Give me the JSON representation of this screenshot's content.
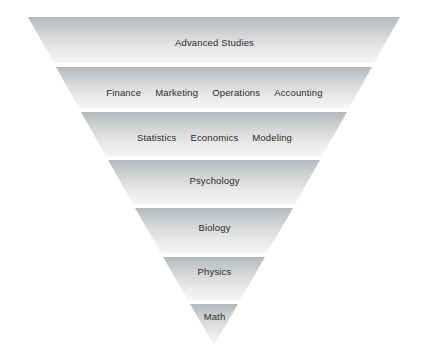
{
  "diagram": {
    "type": "inverted-pyramid-funnel",
    "title": "",
    "background_color": "#ffffff",
    "text_color": "#2b2b2b",
    "band_gradient": {
      "top_color": "#b6b9bb",
      "bottom_color": "#f2f3f3"
    },
    "apex": {
      "x": 214,
      "y": 345
    },
    "top_left": {
      "x": 28,
      "y": 17
    },
    "top_right": {
      "x": 400,
      "y": 17
    },
    "bands": [
      {
        "index": 1,
        "name": "advanced-studies",
        "labels": [
          "Advanced Studies"
        ],
        "label_y": 43,
        "top_y": 17,
        "bottom_y": 63,
        "top_left_x": 28,
        "top_right_x": 400,
        "bottom_left_x": 54,
        "bottom_right_x": 374
      },
      {
        "index": 2,
        "name": "business-disciplines",
        "labels": [
          "Finance",
          "Marketing",
          "Operations",
          "Accounting"
        ],
        "label_y": 93,
        "top_y": 67,
        "bottom_y": 108,
        "top_left_x": 56,
        "top_right_x": 372,
        "bottom_left_x": 79,
        "bottom_right_x": 349
      },
      {
        "index": 3,
        "name": "quantitative-disciplines",
        "labels": [
          "Statistics",
          "Economics",
          "Modeling"
        ],
        "label_y": 138,
        "top_y": 112,
        "bottom_y": 156,
        "top_left_x": 81,
        "top_right_x": 347,
        "bottom_left_x": 106,
        "bottom_right_x": 322
      },
      {
        "index": 4,
        "name": "psychology",
        "labels": [
          "Psychology"
        ],
        "label_y": 181,
        "top_y": 160,
        "bottom_y": 204,
        "top_left_x": 108,
        "top_right_x": 320,
        "bottom_left_x": 133,
        "bottom_right_x": 295
      },
      {
        "index": 5,
        "name": "biology",
        "labels": [
          "Biology"
        ],
        "label_y": 228,
        "top_y": 208,
        "bottom_y": 253,
        "top_left_x": 135,
        "top_right_x": 293,
        "bottom_left_x": 161,
        "bottom_right_x": 267
      },
      {
        "index": 6,
        "name": "physics",
        "labels": [
          "Physics"
        ],
        "label_y": 272,
        "top_y": 257,
        "bottom_y": 300,
        "top_left_x": 163,
        "top_right_x": 265,
        "bottom_left_x": 188,
        "bottom_right_x": 240
      },
      {
        "index": 7,
        "name": "math",
        "labels": [
          "Math"
        ],
        "label_y": 317,
        "top_y": 304,
        "bottom_y": 345,
        "top_left_x": 190,
        "top_right_x": 238,
        "bottom_left_x": 214,
        "bottom_right_x": 214
      }
    ]
  }
}
